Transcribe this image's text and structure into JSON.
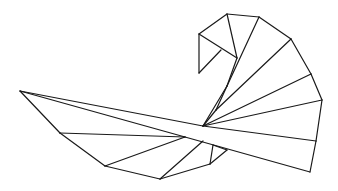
{
  "figure": {
    "stroke_color": "#1a1a1a",
    "background": "#ffffff",
    "segments": [
      [
        20,
        91,
        60,
        133
      ],
      [
        60,
        133,
        105,
        166
      ],
      [
        105,
        166,
        160,
        179
      ],
      [
        160,
        179,
        210,
        164
      ],
      [
        20,
        91,
        203,
        126
      ],
      [
        203,
        126,
        316,
        141
      ],
      [
        20,
        91,
        185,
        137
      ],
      [
        185,
        137,
        310,
        172
      ],
      [
        316,
        141,
        310,
        172
      ],
      [
        60,
        133,
        185,
        137
      ],
      [
        105,
        166,
        185,
        137
      ],
      [
        160,
        179,
        203,
        141
      ],
      [
        210,
        164,
        213,
        145
      ],
      [
        213,
        145,
        227,
        150
      ],
      [
        227,
        150,
        210,
        164
      ],
      [
        203,
        126,
        216,
        110
      ],
      [
        216,
        110,
        227,
        86
      ],
      [
        227,
        86,
        237,
        58
      ],
      [
        203,
        126,
        227,
        86
      ],
      [
        203,
        126,
        322,
        100
      ],
      [
        203,
        126,
        311,
        74
      ],
      [
        216,
        110,
        291,
        39
      ],
      [
        227,
        86,
        259,
        17
      ],
      [
        237,
        58,
        227,
        14
      ],
      [
        199,
        34,
        227,
        14
      ],
      [
        227,
        14,
        259,
        17
      ],
      [
        259,
        17,
        291,
        39
      ],
      [
        291,
        39,
        311,
        74
      ],
      [
        311,
        74,
        322,
        100
      ],
      [
        322,
        100,
        316,
        141
      ],
      [
        199,
        34,
        237,
        58
      ],
      [
        199,
        34,
        199,
        73
      ],
      [
        199,
        73,
        221,
        50
      ]
    ]
  }
}
